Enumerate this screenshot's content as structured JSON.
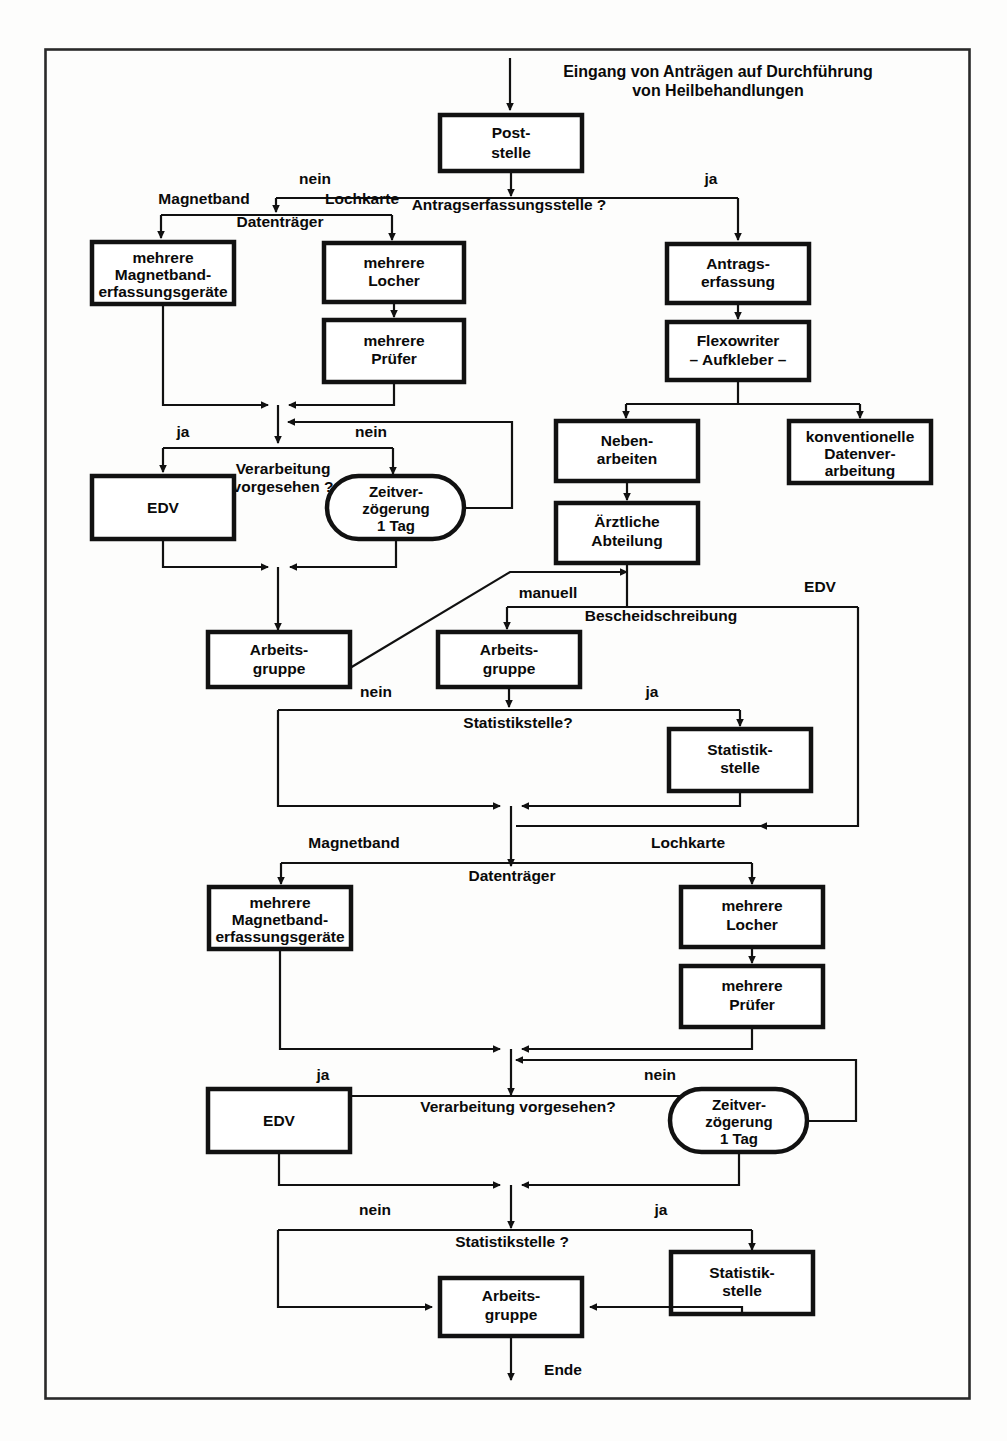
{
  "diagram": {
    "title_lines": [
      "Eingang von Anträgen auf Durchführung",
      "von Heilbehandlungen"
    ],
    "end_label": "Ende",
    "frame_color": "#2a2a2a",
    "box_color": "#111111",
    "background": "#fdfdfc"
  },
  "nodes": {
    "poststelle": {
      "l1": "Post-",
      "l2": "stelle"
    },
    "magnetband_geraete_1": {
      "l1": "mehrere",
      "l2": "Magnetband-",
      "l3": "erfassungsgeräte"
    },
    "locher_1": {
      "l1": "mehrere",
      "l2": "Locher"
    },
    "pruefer_1": {
      "l1": "mehrere",
      "l2": "Prüfer"
    },
    "antragserfassung": {
      "l1": "Antrags-",
      "l2": "erfassung"
    },
    "flexowriter": {
      "l1": "Flexowriter",
      "l2": "– Aufkleber –"
    },
    "nebenarbeiten": {
      "l1": "Neben-",
      "l2": "arbeiten"
    },
    "konventionelle_dv": {
      "l1": "konventionelle",
      "l2": "Datenver-",
      "l3": "arbeitung"
    },
    "aerztliche_abteilung": {
      "l1": "Ärztliche",
      "l2": "Abteilung"
    },
    "edv_1": {
      "l1": "EDV"
    },
    "zeitverzoegerung_1": {
      "l1": "Zeitver-",
      "l2": "zögerung",
      "l3": "1 Tag"
    },
    "arbeitsgruppe_1": {
      "l1": "Arbeits-",
      "l2": "gruppe"
    },
    "arbeitsgruppe_2": {
      "l1": "Arbeits-",
      "l2": "gruppe"
    },
    "statistikstelle_1": {
      "l1": "Statistik-",
      "l2": "stelle"
    },
    "magnetband_geraete_2": {
      "l1": "mehrere",
      "l2": "Magnetband-",
      "l3": "erfassungsgeräte"
    },
    "locher_2": {
      "l1": "mehrere",
      "l2": "Locher"
    },
    "pruefer_2": {
      "l1": "mehrere",
      "l2": "Prüfer"
    },
    "edv_2": {
      "l1": "EDV"
    },
    "zeitverzoegerung_2": {
      "l1": "Zeitver-",
      "l2": "zögerung",
      "l3": "1 Tag"
    },
    "statistikstelle_2": {
      "l1": "Statistik-",
      "l2": "stelle"
    },
    "arbeitsgruppe_3": {
      "l1": "Arbeits-",
      "l2": "gruppe"
    }
  },
  "decisions": {
    "antragserfassungsstelle": "Antragserfassungsstelle ?",
    "datentraeger_1": "Datenträger",
    "verarbeitung_1_a": "Verarbeitung",
    "verarbeitung_1_b": "vorgesehen ?",
    "bescheidschreibung": "Bescheidschreibung",
    "statistikstelle_q1": "Statistikstelle?",
    "datentraeger_2": "Datenträger",
    "verarbeitung_2": "Verarbeitung vorgesehen?",
    "statistikstelle_q2": "Statistikstelle ?"
  },
  "edge_labels": {
    "nein_top": "nein",
    "ja_top": "ja",
    "magnetband_1": "Magnetband",
    "lochkarte_1": "Lochkarte",
    "ja_verarb_1": "ja",
    "nein_verarb_1": "nein",
    "manuell": "manuell",
    "edv_branch": "EDV",
    "nein_stat_1": "nein",
    "ja_stat_1": "ja",
    "magnetband_2": "Magnetband",
    "lochkarte_2": "Lochkarte",
    "ja_verarb_2": "ja",
    "nein_verarb_2": "nein",
    "nein_stat_2": "nein",
    "ja_stat_2": "ja"
  }
}
